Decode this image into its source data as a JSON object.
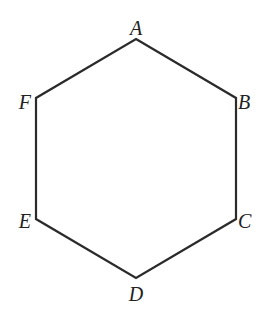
{
  "diagram": {
    "type": "regular-hexagon",
    "stroke_color": "#2b2b2b",
    "label_color": "#222222",
    "background": "#ffffff",
    "vertices": [
      {
        "name": "A",
        "label": "A",
        "x": 136,
        "y": 39,
        "lx": 136,
        "ly": 35,
        "anchor": "middle"
      },
      {
        "name": "B",
        "label": "B",
        "x": 236,
        "y": 98,
        "lx": 238,
        "ly": 109,
        "anchor": "start"
      },
      {
        "name": "C",
        "label": "C",
        "x": 236,
        "y": 219,
        "lx": 238,
        "ly": 228,
        "anchor": "start"
      },
      {
        "name": "D",
        "label": "D",
        "x": 136,
        "y": 278,
        "lx": 136,
        "ly": 301,
        "anchor": "middle"
      },
      {
        "name": "E",
        "label": "E",
        "x": 36,
        "y": 219,
        "lx": 31,
        "ly": 228,
        "anchor": "end"
      },
      {
        "name": "F",
        "label": "F",
        "x": 36,
        "y": 98,
        "lx": 31,
        "ly": 109,
        "anchor": "end"
      }
    ],
    "edges": [
      [
        "A",
        "B"
      ],
      [
        "B",
        "C"
      ],
      [
        "C",
        "D"
      ],
      [
        "D",
        "E"
      ],
      [
        "E",
        "F"
      ],
      [
        "F",
        "A"
      ]
    ]
  }
}
